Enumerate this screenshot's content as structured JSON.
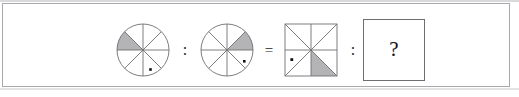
{
  "puzzle": {
    "type": "visual-analogy",
    "statement": "A : B = C : ?",
    "operators": {
      "ratio_1": ":",
      "equals": "=",
      "ratio_2": ":"
    },
    "answer_placeholder": "?",
    "colors": {
      "shading": "#b4b4b6",
      "stroke": "#6f6f73",
      "dot": "#111111",
      "background": "#ffffff",
      "frame": "#a9a9ad"
    },
    "figures": [
      {
        "id": "figure-a",
        "shape": "circle",
        "sectors": 8,
        "shaded_sectors": [
          "upper-left-outer"
        ],
        "shaded_count": 1,
        "dot_position": "lower-right-inner",
        "label": "circle divided into eight sectors, upper-left sector shaded, dot in lower-right sector"
      },
      {
        "id": "figure-b",
        "shape": "circle",
        "sectors": 8,
        "shaded_sectors": [
          "upper-right-outer"
        ],
        "shaded_count": 1,
        "dot_position": "right-lower-inner",
        "label": "circle divided into eight sectors, upper-right sector shaded, dot in right-lower sector"
      },
      {
        "id": "figure-c",
        "shape": "square",
        "sectors": 8,
        "shaded_sectors": [
          "bottom-right-lower"
        ],
        "shaded_count": 1,
        "dot_position": "left-lower-inner",
        "label": "square divided into eight triangles, bottom-right triangle shaded, dot in left-lower triangle"
      },
      {
        "id": "figure-answer",
        "shape": "square",
        "content": "?",
        "label": "empty answer box containing a question mark"
      }
    ]
  }
}
